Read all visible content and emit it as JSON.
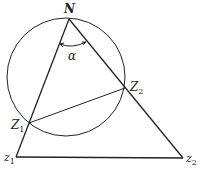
{
  "diagram": {
    "type": "geometry",
    "colors": {
      "stroke": "#222222",
      "background": "#ffffff"
    },
    "circle": {
      "cx": 66,
      "cy": 77,
      "r": 59
    },
    "points": {
      "N": {
        "x": 69,
        "y": 19,
        "label": "N",
        "subscript": ""
      },
      "Z1": {
        "x": 29,
        "y": 123,
        "label": "Z",
        "subscript": "1"
      },
      "Z2": {
        "x": 125,
        "y": 88,
        "label": "Z",
        "subscript": "2"
      },
      "z1": {
        "x": 16,
        "y": 157,
        "label": "z",
        "subscript": "1"
      },
      "z2": {
        "x": 183,
        "y": 158,
        "label": "z",
        "subscript": "2"
      }
    },
    "segments": [
      [
        "N",
        "z1"
      ],
      [
        "N",
        "z2"
      ],
      [
        "z1",
        "z2"
      ],
      [
        "Z1",
        "Z2"
      ]
    ],
    "angle": {
      "vertex": "N",
      "label": "α"
    }
  }
}
